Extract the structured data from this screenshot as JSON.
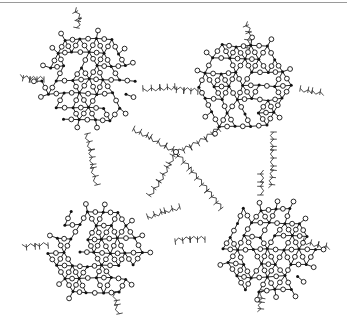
{
  "figure": {
    "colors": {
      "line": "#111111",
      "background": "#ffffff",
      "rule": "#9a9a9a"
    },
    "legend_symbols": {
      "open_circle": "oxygen-atom",
      "filled_dot": "silicon-atom",
      "zigzag_ticked": "alkyl-chain"
    }
  },
  "clusters": [
    {
      "id": "top-left",
      "cx": 88,
      "cy": 80,
      "r": 56,
      "seed": 3
    },
    {
      "id": "top-right",
      "cx": 244,
      "cy": 86,
      "r": 56,
      "seed": 7
    },
    {
      "id": "bottom-left",
      "cx": 95,
      "cy": 252,
      "r": 58,
      "seed": 11
    },
    {
      "id": "bottom-right",
      "cx": 268,
      "cy": 250,
      "r": 56,
      "seed": 19
    }
  ],
  "center_node": {
    "x": 176,
    "y": 152
  },
  "chains": [
    {
      "id": "tl-top",
      "pts": [
        [
          78,
          28
        ],
        [
          80,
          18
        ],
        [
          75,
          8
        ]
      ]
    },
    {
      "id": "tl-left",
      "pts": [
        [
          44,
          78
        ],
        [
          30,
          78
        ],
        [
          20,
          76
        ]
      ]
    },
    {
      "id": "tl-right",
      "pts": [
        [
          143,
          90
        ],
        [
          160,
          89
        ],
        [
          175,
          88
        ]
      ]
    },
    {
      "id": "tl-bottom",
      "pts": [
        [
          86,
          134
        ],
        [
          90,
          150
        ],
        [
          92,
          168
        ],
        [
          96,
          185
        ]
      ]
    },
    {
      "id": "tl-center",
      "pts": [
        [
          133,
          130
        ],
        [
          150,
          138
        ],
        [
          165,
          147
        ],
        [
          176,
          152
        ]
      ]
    },
    {
      "id": "tr-top",
      "pts": [
        [
          248,
          48
        ],
        [
          250,
          32
        ],
        [
          246,
          22
        ]
      ]
    },
    {
      "id": "tr-left",
      "pts": [
        [
          198,
          90
        ],
        [
          184,
          89
        ],
        [
          173,
          88
        ]
      ]
    },
    {
      "id": "tr-right",
      "pts": [
        [
          300,
          90
        ],
        [
          312,
          92
        ],
        [
          324,
          94
        ]
      ]
    },
    {
      "id": "tr-bottom",
      "pts": [
        [
          272,
          132
        ],
        [
          272,
          150
        ],
        [
          272,
          170
        ],
        [
          270,
          188
        ]
      ]
    },
    {
      "id": "tr-center",
      "pts": [
        [
          218,
          128
        ],
        [
          205,
          138
        ],
        [
          190,
          146
        ],
        [
          176,
          152
        ]
      ]
    },
    {
      "id": "bl-left",
      "pts": [
        [
          48,
          244
        ],
        [
          35,
          245
        ],
        [
          22,
          246
        ]
      ]
    },
    {
      "id": "bl-right",
      "pts": [
        [
          148,
          218
        ],
        [
          165,
          212
        ],
        [
          180,
          208
        ]
      ]
    },
    {
      "id": "bl-bottom",
      "pts": [
        [
          114,
          292
        ],
        [
          116,
          305
        ],
        [
          118,
          314
        ]
      ]
    },
    {
      "id": "bl-center",
      "pts": [
        [
          150,
          196
        ],
        [
          160,
          182
        ],
        [
          170,
          164
        ],
        [
          176,
          152
        ]
      ]
    },
    {
      "id": "br-left",
      "pts": [
        [
          205,
          238
        ],
        [
          190,
          238
        ],
        [
          175,
          240
        ]
      ]
    },
    {
      "id": "br-right",
      "pts": [
        [
          303,
          242
        ],
        [
          318,
          246
        ],
        [
          330,
          248
        ]
      ]
    },
    {
      "id": "br-bottom",
      "pts": [
        [
          262,
          290
        ],
        [
          260,
          302
        ],
        [
          259,
          312
        ]
      ]
    },
    {
      "id": "br-top",
      "pts": [
        [
          262,
          195
        ],
        [
          262,
          182
        ],
        [
          262,
          170
        ]
      ]
    },
    {
      "id": "br-center",
      "pts": [
        [
          222,
          208
        ],
        [
          208,
          190
        ],
        [
          190,
          168
        ],
        [
          176,
          152
        ]
      ]
    }
  ]
}
